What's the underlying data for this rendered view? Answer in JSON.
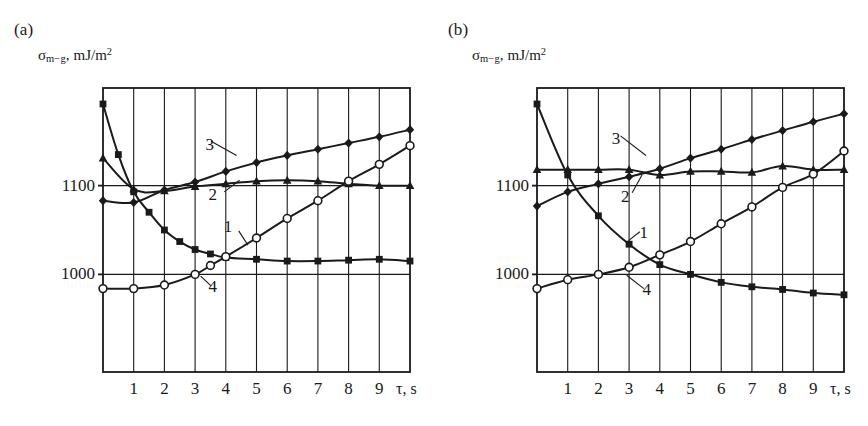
{
  "figure": {
    "width": 868,
    "height": 426,
    "background": "#ffffff",
    "ink": "#1a1a1a"
  },
  "axis_label_y": {
    "symbol": "σ",
    "subscript": "m−g",
    "units": "mJ/m",
    "units_exponent": "2",
    "separator": ","
  },
  "axis_label_x": "τ, s",
  "panels": [
    {
      "tag": "(a)",
      "chart_data": {
        "type": "line",
        "title": "(a)",
        "xlabel": "τ, s",
        "ylabel": "σ m−g, mJ/m2",
        "xlim": [
          0,
          10
        ],
        "ylim": [
          890,
          1210
        ],
        "xticks": [
          1,
          2,
          3,
          4,
          5,
          6,
          7,
          8,
          9
        ],
        "yticks": [
          1000,
          1100
        ],
        "xticklabels": [
          "1",
          "2",
          "3",
          "4",
          "5",
          "6",
          "7",
          "8",
          "9"
        ],
        "yticklabels": [
          "1000",
          "1100"
        ],
        "grid": "vertical-at-xticks-plus-horizontal-at-yticks",
        "legend": "inline-curve-numbers",
        "series": [
          {
            "name": "1",
            "marker": "filled-square",
            "label_position": {
              "x": 4.1,
              "y": 1053
            },
            "x": [
              0,
              0.5,
              1,
              1.5,
              2,
              2.5,
              3,
              3.5,
              4,
              5,
              6,
              7,
              8,
              9,
              10
            ],
            "values": [
              1192,
              1135,
              1093,
              1070,
              1050,
              1037,
              1028,
              1023,
              1019,
              1017,
              1015,
              1015,
              1016,
              1017,
              1015
            ]
          },
          {
            "name": "2",
            "marker": "filled-triangle",
            "label_position": {
              "x": 3.6,
              "y": 1090
            },
            "x": [
              0,
              1,
              2,
              3,
              4,
              5,
              6,
              7,
              8,
              9,
              10
            ],
            "values": [
              1131,
              1096,
              1094,
              1099,
              1102,
              1105,
              1106,
              1105,
              1102,
              1100,
              1100
            ]
          },
          {
            "name": "3",
            "marker": "filled-diamond",
            "label_position": {
              "x": 3.5,
              "y": 1146
            },
            "x": [
              0,
              1,
              2,
              3,
              4,
              5,
              6,
              7,
              8,
              9,
              10
            ],
            "values": [
              1083,
              1081,
              1095,
              1104,
              1116,
              1126,
              1134,
              1141,
              1148,
              1155,
              1163
            ]
          },
          {
            "name": "4",
            "marker": "open-circle",
            "label_position": {
              "x": 3.6,
              "y": 986
            },
            "x": [
              0,
              1,
              2,
              3,
              3.5,
              4,
              5,
              6,
              7,
              8,
              9,
              10
            ],
            "values": [
              984,
              984,
              988,
              1000,
              1010,
              1020,
              1041,
              1063,
              1083,
              1105,
              1124,
              1145
            ]
          }
        ]
      }
    },
    {
      "tag": "(b)",
      "chart_data": {
        "type": "line",
        "title": "(b)",
        "xlabel": "τ, s",
        "ylabel": "σ m−g, mJ/m2",
        "xlim": [
          0,
          10
        ],
        "ylim": [
          890,
          1210
        ],
        "xticks": [
          1,
          2,
          3,
          4,
          5,
          6,
          7,
          8,
          9
        ],
        "yticks": [
          1000,
          1100
        ],
        "xticklabels": [
          "1",
          "2",
          "3",
          "4",
          "5",
          "6",
          "7",
          "8",
          "9"
        ],
        "yticklabels": [
          "1000",
          "1100"
        ],
        "grid": "vertical-at-xticks-plus-horizontal-at-yticks",
        "legend": "inline-curve-numbers",
        "series": [
          {
            "name": "1",
            "marker": "filled-square",
            "label_position": {
              "x": 3.5,
              "y": 1047
            },
            "x": [
              0,
              1,
              2,
              3,
              4,
              5,
              6,
              7,
              8,
              9,
              10
            ],
            "values": [
              1192,
              1112,
              1066,
              1034,
              1011,
              1000,
              991,
              986,
              983,
              979,
              977
            ]
          },
          {
            "name": "2",
            "marker": "filled-triangle",
            "label_position": {
              "x": 2.9,
              "y": 1087
            },
            "x": [
              0,
              1,
              2,
              3,
              4,
              5,
              6,
              7,
              8,
              9,
              10
            ],
            "values": [
              1118,
              1118,
              1118,
              1118,
              1112,
              1116,
              1116,
              1115,
              1122,
              1118,
              1118
            ]
          },
          {
            "name": "3",
            "marker": "filled-diamond",
            "label_position": {
              "x": 2.6,
              "y": 1152
            },
            "x": [
              0,
              1,
              2,
              3,
              4,
              5,
              6,
              7,
              8,
              9,
              10
            ],
            "values": [
              1077,
              1093,
              1102,
              1110,
              1119,
              1131,
              1141,
              1152,
              1162,
              1172,
              1181
            ]
          },
          {
            "name": "4",
            "marker": "open-circle",
            "label_position": {
              "x": 3.6,
              "y": 982
            },
            "x": [
              0,
              1,
              2,
              3,
              4,
              5,
              6,
              7,
              8,
              9,
              10
            ],
            "values": [
              984,
              994,
              1000,
              1008,
              1022,
              1037,
              1057,
              1076,
              1098,
              1113,
              1139
            ]
          }
        ]
      }
    }
  ]
}
